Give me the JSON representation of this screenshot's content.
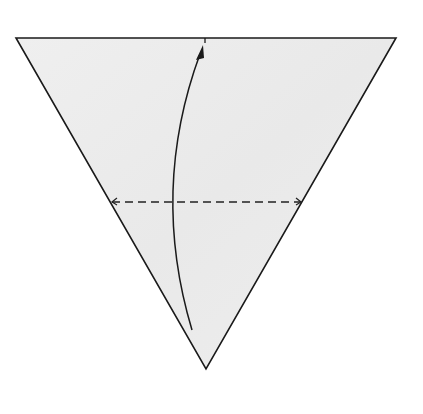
{
  "diagram": {
    "type": "origami-fold-step",
    "colors": {
      "background": "#ffffff",
      "paper_fill": "#ececec",
      "outline": "#1a1a1a",
      "dashed_line": "#222222",
      "arrow": "#1a1a1a"
    },
    "paper": {
      "shape": "inverted-triangle",
      "points": [
        [
          16,
          38
        ],
        [
          396,
          38
        ],
        [
          206,
          369
        ]
      ]
    },
    "valley_fold_line": {
      "style": "dashed",
      "from": [
        110,
        202
      ],
      "to": [
        302,
        202
      ],
      "end_marks": "small-arrowheads"
    },
    "fold_arrow": {
      "start": [
        192,
        330
      ],
      "control": [
        150,
        190
      ],
      "end": [
        203,
        46
      ],
      "direction": "up",
      "target_mark": [
        205,
        40
      ]
    }
  }
}
